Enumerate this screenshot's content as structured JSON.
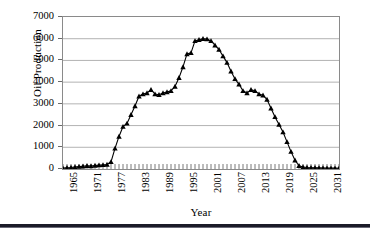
{
  "chart_data": {
    "type": "line",
    "title": "",
    "xlabel": "Year",
    "ylabel": "Oil Production",
    "xlim": [
      1965,
      2034
    ],
    "ylim": [
      0,
      7000
    ],
    "grid": true,
    "legend": null,
    "marker": "triangle",
    "ytick_labels": [
      "7000",
      "6000",
      "5000",
      "4000",
      "3000",
      "2000",
      "1000",
      "0"
    ],
    "ytick_values": [
      7000,
      6000,
      5000,
      4000,
      3000,
      2000,
      1000,
      0
    ],
    "xtick_labels": [
      "1965",
      "1971",
      "1977",
      "1983",
      "1989",
      "1995",
      "2001",
      "2007",
      "2013",
      "2019",
      "2025",
      "2031"
    ],
    "xtick_values": [
      1965,
      1971,
      1977,
      1983,
      1989,
      1995,
      2001,
      2007,
      2013,
      2019,
      2025,
      2031
    ],
    "x_minor_tick_interval": 1,
    "series": [
      {
        "name": "Oil Production",
        "x": [
          1965,
          1966,
          1967,
          1968,
          1969,
          1970,
          1971,
          1972,
          1973,
          1974,
          1975,
          1976,
          1977,
          1978,
          1979,
          1980,
          1981,
          1982,
          1983,
          1984,
          1985,
          1986,
          1987,
          1988,
          1989,
          1990,
          1991,
          1992,
          1993,
          1994,
          1995,
          1996,
          1997,
          1998,
          1999,
          2000,
          2001,
          2002,
          2003,
          2004,
          2005,
          2006,
          2007,
          2008,
          2009,
          2010,
          2011,
          2012,
          2013,
          2014,
          2015,
          2016,
          2017,
          2018,
          2019,
          2020,
          2021,
          2022,
          2023,
          2024,
          2025,
          2026,
          2027,
          2028,
          2029,
          2030,
          2031,
          2032,
          2033,
          2034
        ],
        "values": [
          40,
          60,
          70,
          90,
          110,
          130,
          150,
          140,
          160,
          180,
          190,
          210,
          330,
          950,
          1500,
          1950,
          2100,
          2500,
          2900,
          3350,
          3450,
          3500,
          3650,
          3450,
          3420,
          3500,
          3550,
          3600,
          3800,
          4200,
          4700,
          5300,
          5350,
          5900,
          5950,
          6000,
          5980,
          5900,
          5700,
          5500,
          5200,
          4900,
          4500,
          4150,
          3900,
          3600,
          3500,
          3650,
          3600,
          3450,
          3400,
          3200,
          2800,
          2400,
          2050,
          1700,
          1250,
          800,
          400,
          150,
          90,
          70,
          60,
          55,
          50,
          45,
          42,
          40,
          38,
          36
        ]
      }
    ]
  }
}
